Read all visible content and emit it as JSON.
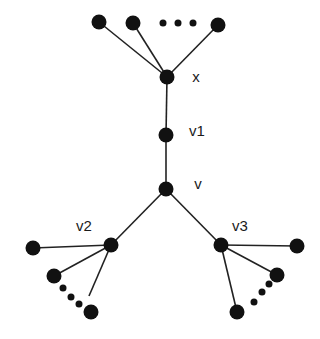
{
  "diagram": {
    "type": "tree-graph",
    "colors": {
      "node": "#111111",
      "edge": "#222222",
      "label": "#1a1a1a",
      "background": "#ffffff"
    },
    "nodes": [
      {
        "id": "x",
        "label": "x",
        "x": 167,
        "y": 77,
        "r": 7.5,
        "label_x": 196,
        "label_y": 82
      },
      {
        "id": "v1",
        "label": "v1",
        "x": 166,
        "y": 135,
        "r": 7.5,
        "label_x": 197,
        "label_y": 136
      },
      {
        "id": "v",
        "label": "v",
        "x": 166,
        "y": 189,
        "r": 7.5,
        "label_x": 198,
        "label_y": 189
      },
      {
        "id": "v2",
        "label": "v2",
        "x": 111,
        "y": 245,
        "r": 7.5,
        "label_x": 84,
        "label_y": 231
      },
      {
        "id": "v3",
        "label": "v3",
        "x": 221,
        "y": 245,
        "r": 7.5,
        "label_x": 240,
        "label_y": 231
      },
      {
        "id": "t1",
        "label": "",
        "x": 99,
        "y": 22,
        "r": 7.5
      },
      {
        "id": "t2",
        "label": "",
        "x": 133,
        "y": 23,
        "r": 7.5
      },
      {
        "id": "t3",
        "label": "",
        "x": 218,
        "y": 25,
        "r": 7.5
      },
      {
        "id": "l1",
        "label": "",
        "x": 33,
        "y": 248,
        "r": 7.5
      },
      {
        "id": "l2",
        "label": "",
        "x": 54,
        "y": 276,
        "r": 7.5
      },
      {
        "id": "l3",
        "label": "",
        "x": 91,
        "y": 312,
        "r": 7.5
      },
      {
        "id": "r1",
        "label": "",
        "x": 297,
        "y": 246,
        "r": 7.5
      },
      {
        "id": "r2",
        "label": "",
        "x": 277,
        "y": 275,
        "r": 7.5
      },
      {
        "id": "r3",
        "label": "",
        "x": 237,
        "y": 312,
        "r": 7.5
      }
    ],
    "edges": [
      {
        "from": "x",
        "to": "t1"
      },
      {
        "from": "x",
        "to": "t2"
      },
      {
        "from": "x",
        "to": "t3"
      },
      {
        "from": "x",
        "to": "v1"
      },
      {
        "from": "v1",
        "to": "v"
      },
      {
        "from": "v",
        "to": "v2"
      },
      {
        "from": "v",
        "to": "v3"
      },
      {
        "from": "v2",
        "to": "l1"
      },
      {
        "from": "v2",
        "to": "l2"
      },
      {
        "from": "v2",
        "to": "l3",
        "end_x": 89,
        "end_y": 296
      },
      {
        "from": "v3",
        "to": "r1"
      },
      {
        "from": "v3",
        "to": "r2"
      },
      {
        "from": "v3",
        "to": "r3"
      }
    ],
    "ellipses": [
      {
        "id": "top-ellipsis",
        "dots": [
          [
            163,
            23
          ],
          [
            178,
            23
          ],
          [
            193,
            23
          ]
        ],
        "r": 3.5
      },
      {
        "id": "left-ellipsis",
        "dots": [
          [
            63,
            288
          ],
          [
            71,
            297
          ],
          [
            79,
            304
          ]
        ],
        "r": 3.5
      },
      {
        "id": "right-ellipsis",
        "dots": [
          [
            254,
            302
          ],
          [
            262,
            292
          ],
          [
            269,
            284
          ]
        ],
        "r": 3.5
      }
    ]
  }
}
